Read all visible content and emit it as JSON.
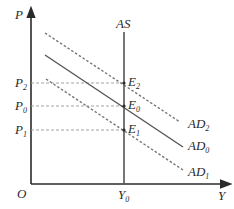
{
  "diagram": {
    "axes": {
      "y_label": "P",
      "x_label": "Y",
      "origin_label": "O"
    },
    "price_levels": [
      {
        "id": "P2",
        "base": "P",
        "sub": "2"
      },
      {
        "id": "P0",
        "base": "P",
        "sub": "0"
      },
      {
        "id": "P1",
        "base": "P",
        "sub": "1"
      }
    ],
    "output_levels": [
      {
        "id": "Y0",
        "base": "Y",
        "sub": "0"
      }
    ],
    "curves": [
      {
        "id": "AS",
        "label": "AS",
        "style": "solid",
        "kind": "vertical"
      },
      {
        "id": "AD2",
        "base": "AD",
        "sub": "2",
        "style": "dashed"
      },
      {
        "id": "AD0",
        "base": "AD",
        "sub": "0",
        "style": "solid"
      },
      {
        "id": "AD1",
        "base": "AD",
        "sub": "1",
        "style": "dashed"
      }
    ],
    "equilibria": [
      {
        "id": "E2",
        "base": "E",
        "sub": "2",
        "price": "P2",
        "output": "Y0"
      },
      {
        "id": "E0",
        "base": "E",
        "sub": "0",
        "price": "P0",
        "output": "Y0"
      },
      {
        "id": "E1",
        "base": "E",
        "sub": "1",
        "price": "P1",
        "output": "Y0"
      }
    ],
    "colors": {
      "line": "#2a2a2a",
      "dashed": "#777777"
    }
  }
}
